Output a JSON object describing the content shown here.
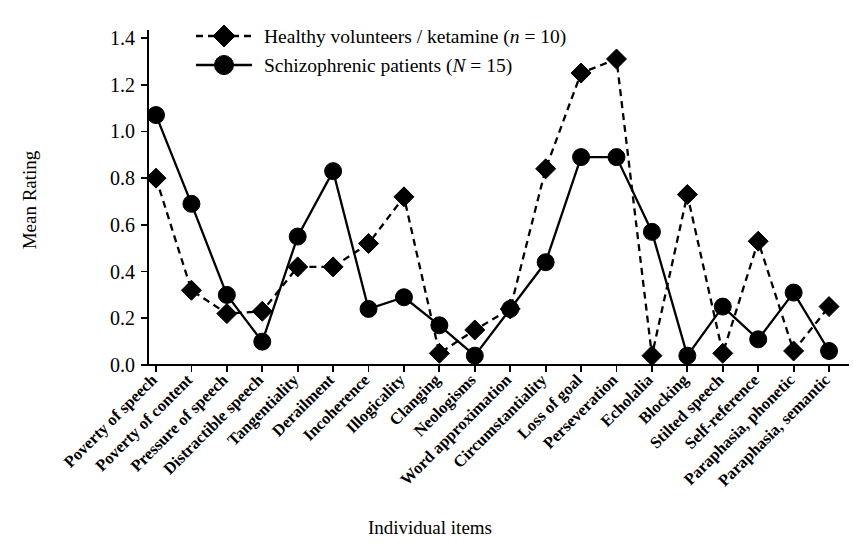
{
  "chart_data": {
    "type": "line",
    "title": "",
    "xlabel": "Individual items",
    "ylabel": "Mean Rating",
    "ylim": [
      0.0,
      1.4
    ],
    "ytick_labels": [
      "0.0",
      "0.2",
      "0.4",
      "0.6",
      "0.8",
      "1.0",
      "1.2",
      "1.4"
    ],
    "ytick_values": [
      0.0,
      0.2,
      0.4,
      0.6,
      0.8,
      1.0,
      1.2,
      1.4
    ],
    "grid": false,
    "legend_position": "top-left",
    "categories": [
      "Poverty of speech",
      "Poverty of content",
      "Pressure of speech",
      "Distractible speech",
      "Tangentiality",
      "Derailment",
      "Incoherence",
      "Illogicality",
      "Clanging",
      "Neologisms",
      "Word approximation",
      "Circumstantiality",
      "Loss of goal",
      "Perseveration",
      "Echolalia",
      "Blocking",
      "Stilted speech",
      "Self-reference",
      "Paraphasia, phonetic",
      "Paraphasia, semantic"
    ],
    "series": [
      {
        "name": "Healthy volunteers / ketamine (n = 10)",
        "marker": "diamond",
        "linestyle": "dashed",
        "color": "#000000",
        "values": [
          0.8,
          0.32,
          0.22,
          0.23,
          0.42,
          0.42,
          0.52,
          0.72,
          0.05,
          0.15,
          0.24,
          0.84,
          1.25,
          1.31,
          0.04,
          0.73,
          0.05,
          0.53,
          0.06,
          0.25
        ]
      },
      {
        "name": "Schizophrenic patients (N = 15)",
        "marker": "circle",
        "linestyle": "solid",
        "color": "#000000",
        "values": [
          1.07,
          0.69,
          0.3,
          0.1,
          0.55,
          0.83,
          0.24,
          0.29,
          0.17,
          0.04,
          0.24,
          0.44,
          0.89,
          0.89,
          0.57,
          0.04,
          0.25,
          0.11,
          0.31,
          0.06
        ]
      }
    ],
    "legend": [
      {
        "label_plain": "Healthy volunteers / ketamine (n = 10)",
        "label_prefix": "Healthy volunteers / ketamine (",
        "label_italic": "n",
        "label_suffix": " = 10)",
        "marker": "diamond",
        "linestyle": "dashed"
      },
      {
        "label_plain": "Schizophrenic patients (N = 15)",
        "label_prefix": "Schizophrenic patients (",
        "label_italic": "N",
        "label_suffix": " = 15)",
        "marker": "circle",
        "linestyle": "solid"
      }
    ]
  }
}
